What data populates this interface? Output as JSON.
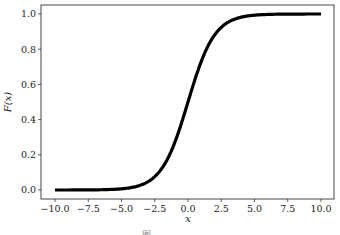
{
  "chart_data": {
    "type": "line",
    "title": "",
    "xlabel": "x",
    "ylabel": "F(x)",
    "xlim": [
      -10.7,
      11.0
    ],
    "ylim": [
      -0.05,
      1.05
    ],
    "grid": false,
    "legend": null,
    "x_ticks": [
      -10.0,
      -7.5,
      -5.0,
      -2.5,
      0.0,
      2.5,
      5.0,
      7.5,
      10.0
    ],
    "x_tick_labels": [
      "−10.0",
      "−7.5",
      "−5.0",
      "−2.5",
      "0.0",
      "2.5",
      "5.0",
      "7.5",
      "10.0"
    ],
    "y_ticks": [
      0.0,
      0.2,
      0.4,
      0.6,
      0.8,
      1.0
    ],
    "y_tick_labels": [
      "0.0",
      "0.2",
      "0.4",
      "0.6",
      "0.8",
      "1.0"
    ],
    "series": [
      {
        "name": "F(x) = 1/(1+e^(-x))",
        "color": "#000000",
        "x": [
          -10,
          -8,
          -6,
          -5,
          -4,
          -3,
          -2.5,
          -2,
          -1.5,
          -1,
          -0.5,
          0,
          0.5,
          1,
          1.5,
          2,
          2.5,
          3,
          4,
          5,
          6,
          8,
          10
        ],
        "y": [
          5e-05,
          0.0003,
          0.0025,
          0.0067,
          0.018,
          0.047,
          0.076,
          0.119,
          0.182,
          0.269,
          0.378,
          0.5,
          0.622,
          0.731,
          0.818,
          0.881,
          0.924,
          0.953,
          0.982,
          0.993,
          0.9975,
          0.9997,
          0.99995
        ]
      }
    ]
  },
  "caption": "图 … … … …"
}
